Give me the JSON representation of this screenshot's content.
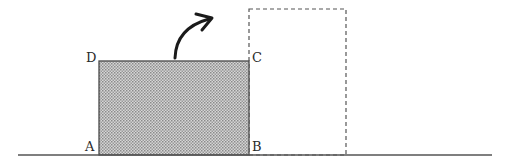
{
  "diagram": {
    "ground": {
      "x1": 18,
      "x2": 492,
      "y": 155,
      "color": "#555555"
    },
    "block": {
      "x": 99,
      "y": 61,
      "width": 150,
      "height": 94,
      "fill": "#bdbdbd",
      "stroke": "#4a4a4a",
      "pattern": "stipple"
    },
    "ghost_block": {
      "x": 249,
      "y": 9,
      "width": 97,
      "height": 146,
      "stroke": "#555555",
      "dash": "4,3"
    },
    "arrow": {
      "start": [
        175,
        58
      ],
      "control": [
        177,
        28
      ],
      "end": [
        211,
        18
      ],
      "color": "#1a1a1a",
      "meaning": "rotation direction"
    },
    "vertices": {
      "A": {
        "text": "A",
        "x": 85,
        "y": 151
      },
      "B": {
        "text": "B",
        "x": 252,
        "y": 151
      },
      "C": {
        "text": "C",
        "x": 252,
        "y": 62
      },
      "D": {
        "text": "D",
        "x": 86,
        "y": 62
      }
    }
  }
}
